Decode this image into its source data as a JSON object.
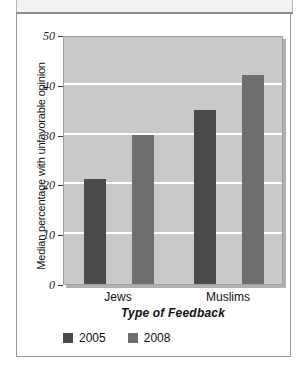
{
  "figure": {
    "frame_border_color": "#9a9a9a",
    "header_strip_color": "#f2f2f2"
  },
  "chart_data": {
    "type": "bar",
    "title": "",
    "subtitle": "",
    "categories": [
      "Jews",
      "Muslims"
    ],
    "series": [
      {
        "name": "2005",
        "values": [
          21,
          35
        ],
        "color": "#4a4a4a"
      },
      {
        "name": "2008",
        "values": [
          30,
          42
        ],
        "color": "#6e6e6e"
      }
    ],
    "xlabel": "Type of Feedback",
    "ylabel": "Median percentage with unfavorable opinion",
    "ylim": [
      0,
      50
    ],
    "ytick_values": [
      0,
      10,
      20,
      30,
      40,
      50
    ],
    "ytick_labels": [
      "0",
      "10",
      "20",
      "30",
      "40",
      "50"
    ],
    "grid": true,
    "gridline_color": "#ffffff",
    "plot_background": "#c9c9c9",
    "legend_position": "bottom-left",
    "legend_entries": [
      "2005",
      "2008"
    ],
    "annotations": []
  }
}
